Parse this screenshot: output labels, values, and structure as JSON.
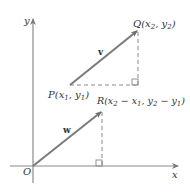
{
  "diagram": {
    "axes": {
      "x_label": "x",
      "y_label": "y",
      "origin_label": "O"
    },
    "points": {
      "P": {
        "name": "P",
        "coords": "(x1, y1)",
        "x_sub": "1",
        "y_sub": "1"
      },
      "Q": {
        "name": "Q",
        "coords": "(x2, y2)",
        "x_sub": "2",
        "y_sub": "2"
      },
      "R": {
        "name": "R",
        "coords": "(x2 − x1, y2 − y1)"
      }
    },
    "vectors": {
      "v": {
        "label": "v",
        "from": "P",
        "to": "Q"
      },
      "w": {
        "label": "w",
        "from": "O",
        "to": "R"
      }
    },
    "colors": {
      "vector": "#7a7a7a",
      "axis": "#7a7a7a",
      "dashed": "#888888",
      "text": "#333333"
    }
  }
}
